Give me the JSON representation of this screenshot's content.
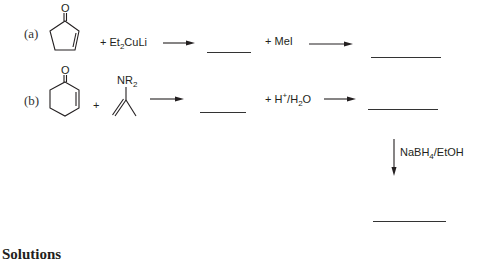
{
  "problems": [
    {
      "label": "(a)",
      "starting_material": "cyclopent-2-en-1-one",
      "starting_material_atom": "O",
      "reagent_1": {
        "prefix": "+ Et",
        "sub": "2",
        "suffix": "CuLi"
      },
      "intermediate_blank": "",
      "reagent_2": "+ MeI",
      "product_blank": ""
    },
    {
      "label": "(b)",
      "starting_material": "cyclohex-2-en-1-one",
      "starting_material_atom": "O",
      "plus": "+",
      "enamine": {
        "group_main": "NR",
        "group_sub": "2"
      },
      "intermediate_blank": "",
      "reagent_2": {
        "prefix": "+ H",
        "sup": "+",
        "slash": "/",
        "h": "H",
        "sub": "2",
        "suffix": "O"
      },
      "product_blank": "",
      "reduction": {
        "prefix": "NaBH",
        "sub": "4",
        "suffix": "/EtOH"
      },
      "final_blank": ""
    }
  ],
  "section_heading": "Solutions"
}
